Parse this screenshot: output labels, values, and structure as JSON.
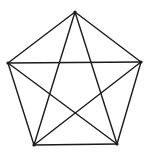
{
  "diagram": {
    "type": "complete-graph-K5",
    "stroke_color": "#1a1a1a",
    "stroke_width": 1.4,
    "vertices": [
      {
        "id": "top",
        "x": 75,
        "y": 12
      },
      {
        "id": "right",
        "x": 141,
        "y": 62
      },
      {
        "id": "bottom-right",
        "x": 117,
        "y": 144
      },
      {
        "id": "bottom-left",
        "x": 34,
        "y": 145
      },
      {
        "id": "left",
        "x": 8,
        "y": 63
      }
    ],
    "edges": [
      [
        "top",
        "right"
      ],
      [
        "right",
        "bottom-right"
      ],
      [
        "bottom-right",
        "bottom-left"
      ],
      [
        "bottom-left",
        "left"
      ],
      [
        "left",
        "top"
      ],
      [
        "top",
        "bottom-right"
      ],
      [
        "top",
        "bottom-left"
      ],
      [
        "left",
        "right"
      ],
      [
        "left",
        "bottom-right"
      ],
      [
        "right",
        "bottom-left"
      ]
    ]
  }
}
